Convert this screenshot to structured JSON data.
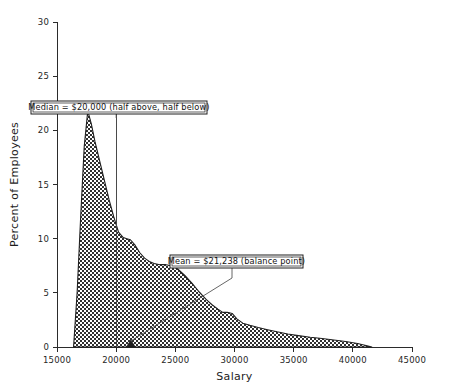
{
  "chart_data": {
    "type": "area",
    "title": "",
    "xlabel": "Salary",
    "ylabel": "Percent of Employees",
    "xlim": [
      15000,
      45000
    ],
    "ylim": [
      0,
      30
    ],
    "xticks": [
      15000,
      20000,
      25000,
      30000,
      35000,
      40000,
      45000
    ],
    "xtick_labels": [
      "15000",
      "20000",
      "25000",
      "30000",
      "35000",
      "40000",
      "45000"
    ],
    "yticks": [
      0,
      5,
      10,
      15,
      20,
      25,
      30
    ],
    "ytick_labels": [
      "0",
      "5",
      "10",
      "15",
      "20",
      "25",
      "30"
    ],
    "grid": false,
    "legend": "none",
    "fill_pattern": "checkerboard-hatch",
    "series": [
      {
        "name": "Salary distribution",
        "x": [
          16400,
          16700,
          17000,
          17300,
          17600,
          17900,
          18200,
          18600,
          19000,
          19400,
          19800,
          20200,
          20600,
          20900,
          21200,
          21600,
          22000,
          22400,
          22800,
          23200,
          23700,
          24200,
          24700,
          25200,
          25800,
          26400,
          27000,
          27600,
          28100,
          28600,
          29000,
          29400,
          29800,
          30200,
          30700,
          31300,
          32000,
          32800,
          33600,
          34500,
          35400,
          36400,
          37400,
          38400,
          39400,
          40400,
          41200,
          41600
        ],
        "y": [
          0.0,
          5.0,
          12.0,
          18.5,
          21.8,
          20.6,
          19.0,
          17.2,
          15.4,
          13.6,
          12.0,
          10.6,
          10.1,
          10.0,
          9.9,
          9.4,
          8.7,
          8.2,
          7.9,
          7.7,
          7.6,
          7.6,
          7.5,
          7.2,
          6.6,
          5.9,
          5.1,
          4.4,
          3.9,
          3.5,
          3.2,
          3.2,
          3.1,
          2.6,
          2.2,
          2.0,
          1.8,
          1.6,
          1.4,
          1.2,
          1.05,
          0.9,
          0.78,
          0.65,
          0.5,
          0.32,
          0.12,
          0.0
        ]
      }
    ],
    "annotations": [
      {
        "id": "median",
        "label": "Median = $20,000 (half above, half below)",
        "value": 20000,
        "marker": "vertical-line"
      },
      {
        "id": "mean",
        "label": "Mean = $21,238 (balance point)",
        "value": 21238,
        "marker": "fulcrum-triangle"
      }
    ]
  },
  "colors": {
    "ink": "#1f1f1f",
    "fill_dark": "#3c3c3c",
    "background": "#ffffff",
    "reference_line": "#4a4a4a"
  }
}
